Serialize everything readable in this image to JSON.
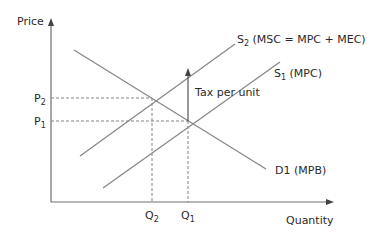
{
  "diagram": {
    "axes": {
      "y_label": "Price",
      "x_label": "Quantity"
    },
    "price_levels": [
      {
        "base": "P",
        "sub": "2"
      },
      {
        "base": "P",
        "sub": "1"
      }
    ],
    "quantity_levels": [
      {
        "base": "Q",
        "sub": "2"
      },
      {
        "base": "Q",
        "sub": "1"
      }
    ],
    "curves": {
      "s2": {
        "base": "S",
        "sub": "2",
        "desc": " (MSC = MPC + MEC)"
      },
      "s1": {
        "base": "S",
        "sub": "1",
        "desc": " (MPC)"
      },
      "d1": {
        "label": "D1 (MPB)"
      }
    },
    "annotation": "Tax per unit",
    "colors": {
      "curve": "#8a8a8a",
      "axis": "#6e6e6e",
      "text": "#2a2a2a"
    }
  }
}
